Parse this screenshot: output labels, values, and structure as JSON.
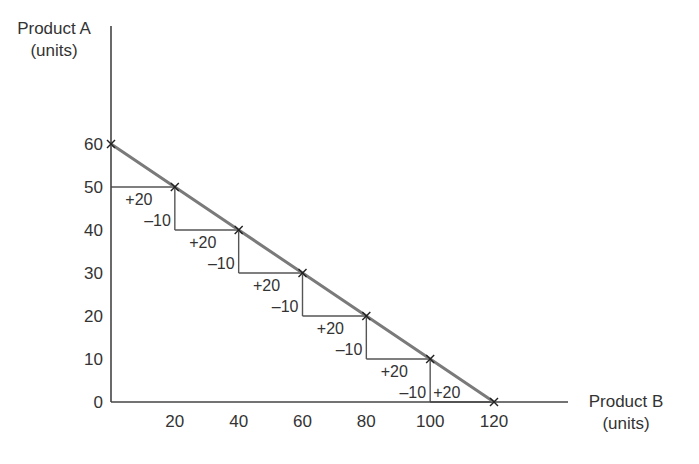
{
  "chart_data": {
    "type": "line",
    "title": "",
    "xlabel": "Product B (units)",
    "ylabel": "Product A (units)",
    "xlabel_lines": [
      "Product B",
      "(units)"
    ],
    "ylabel_lines": [
      "Product A",
      "(units)"
    ],
    "xlim": [
      0,
      140
    ],
    "ylim": [
      0,
      87
    ],
    "x_ticks": [
      20,
      40,
      60,
      80,
      100,
      120
    ],
    "y_ticks": [
      0,
      10,
      20,
      30,
      40,
      50,
      60
    ],
    "grid": false,
    "legend": null,
    "series": [
      {
        "name": "Production possibility frontier",
        "x": [
          0,
          20,
          40,
          60,
          80,
          100,
          120
        ],
        "y": [
          60,
          50,
          40,
          30,
          20,
          10,
          0
        ],
        "color": "#7a7a7a",
        "marker": "x"
      }
    ],
    "annotations": {
      "steps": [
        {
          "from_x": 0,
          "to_x": 20,
          "y": 50,
          "gain_label": "+20",
          "loss_label": null
        },
        {
          "from_x": 20,
          "to_x": 40,
          "y": 40,
          "gain_label": "+20",
          "loss_label": "–10"
        },
        {
          "from_x": 40,
          "to_x": 60,
          "y": 30,
          "gain_label": "+20",
          "loss_label": "–10"
        },
        {
          "from_x": 60,
          "to_x": 80,
          "y": 20,
          "gain_label": "+20",
          "loss_label": "–10"
        },
        {
          "from_x": 80,
          "to_x": 100,
          "y": 10,
          "gain_label": "+20",
          "loss_label": "–10"
        },
        {
          "from_x": 100,
          "to_x": 120,
          "y": 0,
          "gain_label": "+20",
          "loss_label": "–10"
        }
      ],
      "step_color": "#555555"
    }
  },
  "colors": {
    "axis": "#444444",
    "frontier": "#7a7a7a",
    "steps": "#555555",
    "text": "#333333"
  }
}
